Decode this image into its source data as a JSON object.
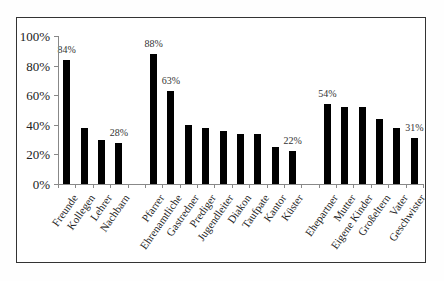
{
  "chart_data": {
    "type": "bar",
    "title": "",
    "xlabel": "",
    "ylabel": "",
    "ylim": [
      0,
      100
    ],
    "yticks": [
      "0%",
      "20%",
      "40%",
      "60%",
      "80%",
      "100%"
    ],
    "categories": [
      "Freunde",
      "Kollegen",
      "Lehrer",
      "Nachbarn",
      "Pfarrer",
      "Ehrenamtliche",
      "Gastredner",
      "Prediger",
      "Jugendleiter",
      "Diakon",
      "Taufpate",
      "Kantor",
      "Küster",
      "Ehepartner",
      "Mutter",
      "Eigene Kinder",
      "Großeltern",
      "Vater",
      "Geschwister"
    ],
    "groups": [
      {
        "name": "group-1",
        "categories": [
          "Freunde",
          "Kollegen",
          "Lehrer",
          "Nachbarn"
        ]
      },
      {
        "name": "group-2",
        "categories": [
          "Pfarrer",
          "Ehrenamtliche",
          "Gastredner",
          "Prediger",
          "Jugendleiter",
          "Diakon",
          "Taufpate",
          "Kantor",
          "Küster"
        ]
      },
      {
        "name": "group-3",
        "categories": [
          "Ehepartner",
          "Mutter",
          "Eigene Kinder",
          "Großeltern",
          "Vater",
          "Geschwister"
        ]
      }
    ],
    "values": [
      84,
      38,
      30,
      28,
      88,
      63,
      40,
      38,
      36,
      34,
      34,
      25,
      22,
      54,
      52,
      52,
      44,
      38,
      31
    ],
    "data_labels": {
      "Freunde": "84%",
      "Nachbarn": "28%",
      "Pfarrer": "88%",
      "Ehrenamtliche": "63%",
      "Küster": "22%",
      "Ehepartner": "54%",
      "Geschwister": "31%"
    },
    "slots": [
      0,
      1,
      2,
      3,
      5,
      6,
      7,
      8,
      9,
      10,
      11,
      12,
      13,
      15,
      16,
      17,
      18,
      19,
      20
    ],
    "grid": false,
    "legend": null,
    "bar_color": "#000000"
  }
}
